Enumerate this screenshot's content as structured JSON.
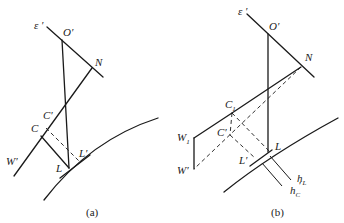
{
  "figure": {
    "panel_a": {
      "caption": "(a)",
      "labels": {
        "epsilon": "ε ′",
        "O": "O′",
        "N": "N",
        "C_prime": "C′",
        "C": "C",
        "W_prime": "W′",
        "L": "L",
        "L_prime": "L′"
      }
    },
    "panel_b": {
      "caption": "(b)",
      "labels": {
        "epsilon": "ε ′",
        "O": "O′",
        "N": "N",
        "C1": "C",
        "C1_sub": "1",
        "C_prime": "C′",
        "W1": "W",
        "W1_sub": "1",
        "W_prime": "W′",
        "L": "L",
        "L_prime": "L′",
        "hL": "h",
        "hL_sub": "L",
        "hC": "h",
        "hC_sub": "C",
        "hC_prime": "′"
      }
    }
  }
}
